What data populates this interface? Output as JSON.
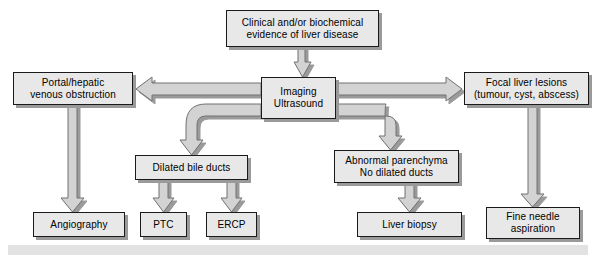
{
  "diagram": {
    "colors": {
      "box_fill": "#e8e8e8",
      "box_border": "#1a1a1a",
      "box_shadow": "#9a9a9a",
      "arrow_fill": "#d0d0d0",
      "arrow_stroke": "#6e6e6e",
      "bottom_bar": "#e2e2e2",
      "background": "#ffffff"
    },
    "nodes": [
      {
        "id": "clinical",
        "label": "Clinical and/or biochemical\nevidence of liver disease",
        "x": 226,
        "y": 10,
        "w": 153,
        "h": 37
      },
      {
        "id": "imaging",
        "label": "Imaging\nUltrasound",
        "x": 261,
        "y": 77,
        "w": 75,
        "h": 42
      },
      {
        "id": "portal",
        "label": "Portal/hepatic\nvenous obstruction",
        "x": 13,
        "y": 72,
        "w": 120,
        "h": 33
      },
      {
        "id": "focal",
        "label": "Focal liver lesions\n(tumour, cyst, abscess)",
        "x": 464,
        "y": 72,
        "w": 125,
        "h": 33
      },
      {
        "id": "dilated",
        "label": "Dilated bile ducts",
        "x": 135,
        "y": 155,
        "w": 113,
        "h": 25
      },
      {
        "id": "abnormal",
        "label": "Abnormal parenchyma\nNo dilated ducts",
        "x": 334,
        "y": 150,
        "w": 125,
        "h": 33
      },
      {
        "id": "angiography",
        "label": "Angiography",
        "x": 33,
        "y": 212,
        "w": 92,
        "h": 25
      },
      {
        "id": "ptc",
        "label": "PTC",
        "x": 140,
        "y": 212,
        "w": 47,
        "h": 25
      },
      {
        "id": "ercp",
        "label": "ERCP",
        "x": 206,
        "y": 212,
        "w": 51,
        "h": 25
      },
      {
        "id": "biopsy",
        "label": "Liver biopsy",
        "x": 357,
        "y": 212,
        "w": 105,
        "h": 25
      },
      {
        "id": "fna",
        "label": "Fine needle\naspiration",
        "x": 486,
        "y": 207,
        "w": 94,
        "h": 32
      }
    ],
    "edges": [
      {
        "from": "clinical",
        "to": "imaging",
        "kind": "vertical-down"
      },
      {
        "from": "imaging",
        "to": "portal",
        "kind": "horizontal-left"
      },
      {
        "from": "imaging",
        "to": "focal",
        "kind": "horizontal-right"
      },
      {
        "from": "imaging",
        "to": "dilated",
        "kind": "elbow-left-down"
      },
      {
        "from": "imaging",
        "to": "abnormal",
        "kind": "elbow-right-down"
      },
      {
        "from": "portal",
        "to": "angiography",
        "kind": "vertical-down"
      },
      {
        "from": "dilated",
        "to": "ptc",
        "kind": "vertical-down"
      },
      {
        "from": "dilated",
        "to": "ercp",
        "kind": "vertical-down"
      },
      {
        "from": "abnormal",
        "to": "biopsy",
        "kind": "vertical-down"
      },
      {
        "from": "focal",
        "to": "fna",
        "kind": "vertical-down"
      }
    ]
  }
}
